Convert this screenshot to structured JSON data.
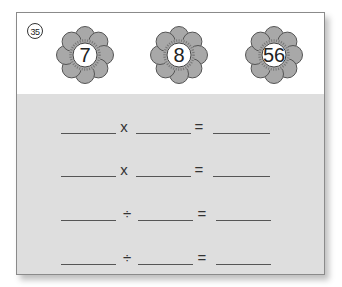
{
  "problem": {
    "number": "35",
    "number_glyph": "㉟",
    "flowers": [
      {
        "value": "7"
      },
      {
        "value": "8"
      },
      {
        "value": "56"
      }
    ],
    "equations": [
      {
        "operator": "x",
        "equals": "="
      },
      {
        "operator": "x",
        "equals": "="
      },
      {
        "operator": "÷",
        "equals": "="
      },
      {
        "operator": "÷",
        "equals": "="
      }
    ]
  },
  "colors": {
    "petal_fill": "#a8a8a8",
    "petal_stroke": "#555555",
    "answer_area": "#dedede",
    "border": "#8a8a8a"
  }
}
